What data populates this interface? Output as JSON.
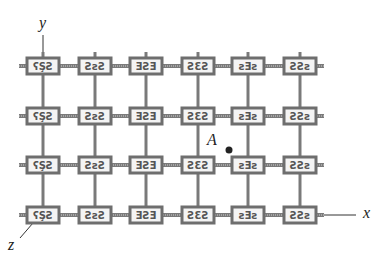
{
  "diagram": {
    "type": "crystal-lattice-grid",
    "columns": 6,
    "rows": 4,
    "col_x": [
      43,
      95,
      146,
      198,
      248,
      300
    ],
    "row_y": [
      66,
      116,
      165,
      215
    ],
    "box": {
      "width": 32,
      "height": 16
    },
    "colors": {
      "frame": "#6e6e6e",
      "rod": "#7a7a7a",
      "text": "#222222",
      "dot": "#222222"
    }
  },
  "labels": {
    "y_axis": "y",
    "x_axis": "x",
    "z_axis": "z",
    "point": "A"
  },
  "point_A": {
    "x": 229,
    "y": 150
  }
}
